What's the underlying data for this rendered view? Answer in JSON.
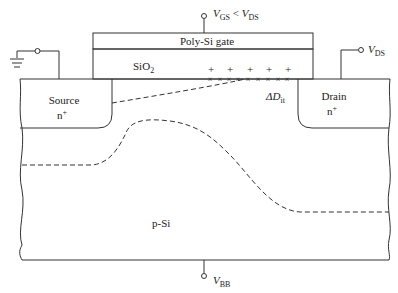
{
  "diagram": {
    "gate": {
      "label": "Poly-Si gate",
      "terminal": {
        "v": "V",
        "sub1": "GS",
        "rel": " < ",
        "v2": "V",
        "sub2": "DS"
      }
    },
    "oxide": {
      "label": "SiO",
      "sub": "2"
    },
    "source": {
      "label": "Source",
      "doping": "n",
      "sup": "+"
    },
    "drain": {
      "label": "Drain",
      "doping": "n",
      "sup": "+"
    },
    "drain_terminal": {
      "v": "V",
      "sub": "DS"
    },
    "substrate": {
      "label": "p-Si"
    },
    "substrate_terminal": {
      "v": "V",
      "sub": "BB"
    },
    "interface_traps": {
      "delta": "ΔD",
      "sub": "it"
    },
    "charges": {
      "plus": "+",
      "cross": "×",
      "plus_count": 5,
      "cross_count": 9
    },
    "ground": {
      "icon": "ground-icon"
    },
    "colors": {
      "line": "#333333",
      "background": "#ffffff"
    }
  }
}
